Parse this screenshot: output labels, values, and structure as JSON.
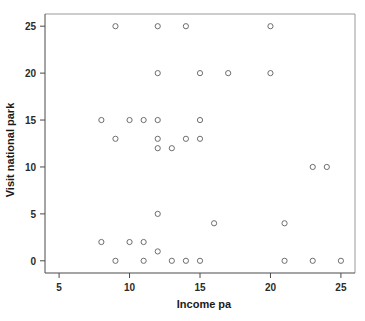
{
  "chart_data": {
    "type": "scatter",
    "title": "",
    "xlabel": "Income pa",
    "ylabel": "Visit national park",
    "xlim": [
      4.0,
      26.0
    ],
    "ylim": [
      -1.3,
      26.3
    ],
    "xticks": [
      5,
      10,
      15,
      20,
      25
    ],
    "yticks": [
      0,
      5,
      10,
      15,
      20,
      25
    ],
    "xticklabels": [
      "5",
      "10",
      "15",
      "20",
      "25"
    ],
    "yticklabels": [
      "0",
      "5",
      "10",
      "15",
      "20",
      "25"
    ],
    "grid": false,
    "legend": null,
    "marker": "open-circle",
    "marker_color": "#6e6e6e",
    "points": [
      {
        "x": 9,
        "y": 25
      },
      {
        "x": 12,
        "y": 25
      },
      {
        "x": 14,
        "y": 25
      },
      {
        "x": 20,
        "y": 25
      },
      {
        "x": 12,
        "y": 20
      },
      {
        "x": 15,
        "y": 20
      },
      {
        "x": 17,
        "y": 20
      },
      {
        "x": 20,
        "y": 20
      },
      {
        "x": 8,
        "y": 15
      },
      {
        "x": 10,
        "y": 15
      },
      {
        "x": 11,
        "y": 15
      },
      {
        "x": 12,
        "y": 15
      },
      {
        "x": 15,
        "y": 15
      },
      {
        "x": 9,
        "y": 13
      },
      {
        "x": 12,
        "y": 13
      },
      {
        "x": 14,
        "y": 13
      },
      {
        "x": 15,
        "y": 13
      },
      {
        "x": 12,
        "y": 12
      },
      {
        "x": 13,
        "y": 12
      },
      {
        "x": 23,
        "y": 10
      },
      {
        "x": 24,
        "y": 10
      },
      {
        "x": 12,
        "y": 5
      },
      {
        "x": 16,
        "y": 4
      },
      {
        "x": 21,
        "y": 4
      },
      {
        "x": 8,
        "y": 2
      },
      {
        "x": 10,
        "y": 2
      },
      {
        "x": 11,
        "y": 2
      },
      {
        "x": 12,
        "y": 1
      },
      {
        "x": 9,
        "y": 0
      },
      {
        "x": 11,
        "y": 0
      },
      {
        "x": 13,
        "y": 0
      },
      {
        "x": 14,
        "y": 0
      },
      {
        "x": 15,
        "y": 0
      },
      {
        "x": 21,
        "y": 0
      },
      {
        "x": 23,
        "y": 0
      },
      {
        "x": 25,
        "y": 0
      }
    ]
  }
}
